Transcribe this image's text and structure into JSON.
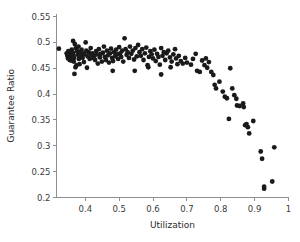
{
  "chart_data": {
    "type": "scatter",
    "title": "",
    "xlabel": "Utilization",
    "ylabel": "Guarantee Ratio",
    "xlim": [
      0.315,
      1.0
    ],
    "ylim": [
      0.2,
      0.555
    ],
    "xticks": [
      0.4,
      0.5,
      0.6,
      0.7,
      0.8,
      0.9,
      1
    ],
    "xticklabels": [
      "0.4",
      "0.5",
      "0.6",
      "0.7",
      "0.8",
      "0.9",
      "1"
    ],
    "yticks": [
      0.2,
      0.25,
      0.3,
      0.35,
      0.4,
      0.45,
      0.5,
      0.55
    ],
    "yticklabels": [
      "0.2",
      "0.25",
      "0.3",
      "0.35",
      "0.4",
      "0.45",
      "0.5",
      "0.55"
    ],
    "grid": false,
    "legend": null,
    "marker": "filled-circle",
    "marker_color": "#1a1a1a",
    "marker_size": 2.4,
    "background_color": "#ffffff",
    "axis_color": "#8f8f8f",
    "points": [
      [
        0.322,
        0.488
      ],
      [
        0.345,
        0.479
      ],
      [
        0.347,
        0.474
      ],
      [
        0.349,
        0.469
      ],
      [
        0.35,
        0.483
      ],
      [
        0.352,
        0.476
      ],
      [
        0.353,
        0.471
      ],
      [
        0.354,
        0.466
      ],
      [
        0.355,
        0.481
      ],
      [
        0.356,
        0.474
      ],
      [
        0.357,
        0.478
      ],
      [
        0.358,
        0.47
      ],
      [
        0.359,
        0.465
      ],
      [
        0.36,
        0.486
      ],
      [
        0.361,
        0.477
      ],
      [
        0.362,
        0.472
      ],
      [
        0.363,
        0.468
      ],
      [
        0.364,
        0.48
      ],
      [
        0.365,
        0.475
      ],
      [
        0.366,
        0.463
      ],
      [
        0.367,
        0.47
      ],
      [
        0.364,
        0.503
      ],
      [
        0.369,
        0.497
      ],
      [
        0.372,
        0.489
      ],
      [
        0.374,
        0.456
      ],
      [
        0.368,
        0.439
      ],
      [
        0.371,
        0.452
      ],
      [
        0.376,
        0.483
      ],
      [
        0.378,
        0.476
      ],
      [
        0.38,
        0.492
      ],
      [
        0.381,
        0.468
      ],
      [
        0.383,
        0.458
      ],
      [
        0.385,
        0.481
      ],
      [
        0.387,
        0.474
      ],
      [
        0.389,
        0.486
      ],
      [
        0.392,
        0.47
      ],
      [
        0.394,
        0.479
      ],
      [
        0.396,
        0.462
      ],
      [
        0.398,
        0.477
      ],
      [
        0.401,
        0.5
      ],
      [
        0.403,
        0.484
      ],
      [
        0.405,
        0.451
      ],
      [
        0.407,
        0.473
      ],
      [
        0.41,
        0.481
      ],
      [
        0.413,
        0.468
      ],
      [
        0.416,
        0.489
      ],
      [
        0.418,
        0.476
      ],
      [
        0.421,
        0.479
      ],
      [
        0.424,
        0.47
      ],
      [
        0.427,
        0.474
      ],
      [
        0.429,
        0.466
      ],
      [
        0.432,
        0.483
      ],
      [
        0.435,
        0.477
      ],
      [
        0.437,
        0.459
      ],
      [
        0.44,
        0.487
      ],
      [
        0.443,
        0.471
      ],
      [
        0.446,
        0.478
      ],
      [
        0.449,
        0.463
      ],
      [
        0.452,
        0.48
      ],
      [
        0.455,
        0.492
      ],
      [
        0.458,
        0.472
      ],
      [
        0.461,
        0.466
      ],
      [
        0.464,
        0.484
      ],
      [
        0.467,
        0.475
      ],
      [
        0.47,
        0.461
      ],
      [
        0.473,
        0.479
      ],
      [
        0.476,
        0.488
      ],
      [
        0.479,
        0.47
      ],
      [
        0.482,
        0.464
      ],
      [
        0.485,
        0.481
      ],
      [
        0.488,
        0.473
      ],
      [
        0.481,
        0.445
      ],
      [
        0.491,
        0.486
      ],
      [
        0.494,
        0.477
      ],
      [
        0.497,
        0.468
      ],
      [
        0.5,
        0.491
      ],
      [
        0.503,
        0.479
      ],
      [
        0.506,
        0.472
      ],
      [
        0.509,
        0.484
      ],
      [
        0.512,
        0.463
      ],
      [
        0.516,
        0.508
      ],
      [
        0.519,
        0.487
      ],
      [
        0.522,
        0.476
      ],
      [
        0.525,
        0.481
      ],
      [
        0.529,
        0.47
      ],
      [
        0.532,
        0.492
      ],
      [
        0.536,
        0.478
      ],
      [
        0.54,
        0.484
      ],
      [
        0.544,
        0.467
      ],
      [
        0.548,
        0.489
      ],
      [
        0.546,
        0.445
      ],
      [
        0.552,
        0.473
      ],
      [
        0.556,
        0.495
      ],
      [
        0.56,
        0.481
      ],
      [
        0.564,
        0.474
      ],
      [
        0.568,
        0.487
      ],
      [
        0.572,
        0.466
      ],
      [
        0.576,
        0.479
      ],
      [
        0.58,
        0.49
      ],
      [
        0.584,
        0.456
      ],
      [
        0.586,
        0.452
      ],
      [
        0.588,
        0.472
      ],
      [
        0.592,
        0.483
      ],
      [
        0.596,
        0.477
      ],
      [
        0.6,
        0.469
      ],
      [
        0.604,
        0.486
      ],
      [
        0.608,
        0.464
      ],
      [
        0.612,
        0.478
      ],
      [
        0.616,
        0.472
      ],
      [
        0.62,
        0.457
      ],
      [
        0.624,
        0.489
      ],
      [
        0.628,
        0.474
      ],
      [
        0.632,
        0.481
      ],
      [
        0.624,
        0.438
      ],
      [
        0.636,
        0.466
      ],
      [
        0.64,
        0.479
      ],
      [
        0.645,
        0.484
      ],
      [
        0.65,
        0.471
      ],
      [
        0.652,
        0.452
      ],
      [
        0.655,
        0.463
      ],
      [
        0.66,
        0.477
      ],
      [
        0.665,
        0.487
      ],
      [
        0.668,
        0.469
      ],
      [
        0.672,
        0.458
      ],
      [
        0.676,
        0.474
      ],
      [
        0.682,
        0.464
      ],
      [
        0.688,
        0.459
      ],
      [
        0.695,
        0.47
      ],
      [
        0.7,
        0.461
      ],
      [
        0.712,
        0.457
      ],
      [
        0.718,
        0.468
      ],
      [
        0.726,
        0.478
      ],
      [
        0.73,
        0.445
      ],
      [
        0.738,
        0.443
      ],
      [
        0.745,
        0.465
      ],
      [
        0.752,
        0.456
      ],
      [
        0.756,
        0.469
      ],
      [
        0.76,
        0.451
      ],
      [
        0.765,
        0.462
      ],
      [
        0.772,
        0.443
      ],
      [
        0.778,
        0.437
      ],
      [
        0.782,
        0.418
      ],
      [
        0.786,
        0.411
      ],
      [
        0.796,
        0.424
      ],
      [
        0.806,
        0.405
      ],
      [
        0.812,
        0.395
      ],
      [
        0.818,
        0.392
      ],
      [
        0.824,
        0.352
      ],
      [
        0.828,
        0.45
      ],
      [
        0.834,
        0.411
      ],
      [
        0.84,
        0.398
      ],
      [
        0.846,
        0.391
      ],
      [
        0.848,
        0.378
      ],
      [
        0.856,
        0.377
      ],
      [
        0.866,
        0.382
      ],
      [
        0.868,
        0.375
      ],
      [
        0.872,
        0.34
      ],
      [
        0.876,
        0.342
      ],
      [
        0.88,
        0.336
      ],
      [
        0.884,
        0.324
      ],
      [
        0.896,
        0.348
      ],
      [
        0.918,
        0.289
      ],
      [
        0.922,
        0.275
      ],
      [
        0.928,
        0.221
      ],
      [
        0.928,
        0.217
      ],
      [
        0.952,
        0.231
      ],
      [
        0.958,
        0.297
      ]
    ]
  }
}
